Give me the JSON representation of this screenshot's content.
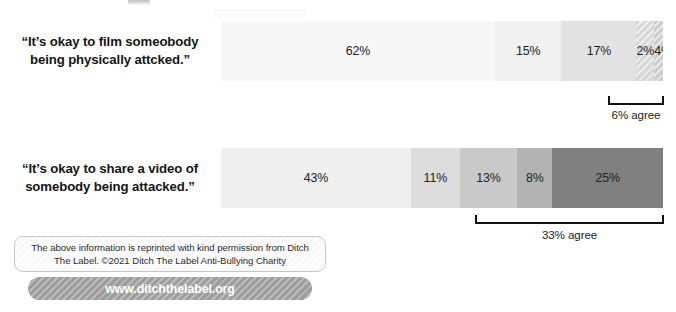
{
  "chart_data": {
    "type": "bar",
    "orientation": "horizontal-stacked",
    "title": "",
    "xlabel": "",
    "ylabel": "",
    "xlim": [
      0,
      100
    ],
    "grid": false,
    "legend": "none",
    "categories": [
      "“It’s okay to film someobody being physically attcked.”",
      "“It’s okay to share a video of somebody being attacked.”"
    ],
    "bars": [
      {
        "label_line_1": "“It’s okay to film someobody",
        "label_line_2": "being physically attcked.”",
        "segments": [
          {
            "value": 62,
            "label": "62%",
            "color": "#f7f7f7",
            "hatched": false
          },
          {
            "value": 15,
            "label": "15%",
            "color": "#f1f1f1",
            "hatched": false
          },
          {
            "value": 17,
            "label": "17%",
            "color": "#e2e2e2",
            "hatched": false
          },
          {
            "value": 2,
            "label": "2%",
            "color": "#d7d7d7",
            "hatched": true
          },
          {
            "value": 4,
            "label": "4%",
            "color": "#cdcdcd",
            "hatched": true
          }
        ],
        "bracket": {
          "label": "6% agree",
          "value": 6,
          "covers": [
            "2%",
            "4%"
          ]
        }
      },
      {
        "label_line_1": "“It’s okay to share a video of",
        "label_line_2": "somebody being attacked.”",
        "segments": [
          {
            "value": 43,
            "label": "43%",
            "color": "#efefef",
            "hatched": false
          },
          {
            "value": 11,
            "label": "11%",
            "color": "#dcdcdc",
            "hatched": false
          },
          {
            "value": 13,
            "label": "13%",
            "color": "#c9c9c9",
            "hatched": false
          },
          {
            "value": 8,
            "label": "8%",
            "color": "#b3b3b3",
            "hatched": false
          },
          {
            "value": 25,
            "label": "25%",
            "color": "#808080",
            "hatched": false
          }
        ],
        "bracket": {
          "label": "33% agree",
          "value": 33,
          "covers": [
            "8%",
            "25%"
          ]
        }
      }
    ]
  },
  "footer": {
    "credit_line_1": "The above information is reprinted with kind permission from Ditch",
    "credit_line_2": "The Label. ©2021 Ditch The Label Anti-Bullying Charity",
    "url": "www.ditchthelabel.org",
    "pill_color": "#9d9d9d"
  }
}
